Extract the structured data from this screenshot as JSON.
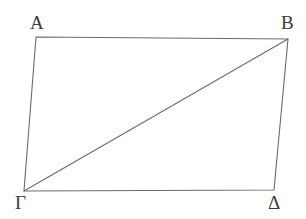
{
  "figure": {
    "type": "geometric-diagram",
    "shape": "parallelogram-with-diagonal",
    "background_color": "#ffffff",
    "stroke_color": "#6b6b6b",
    "stroke_width": 1.1,
    "label_color": "#3a3a3a",
    "canvas": {
      "width": 306,
      "height": 219
    },
    "vertices": [
      {
        "id": "A",
        "label": "Α",
        "x": 36,
        "y": 37
      },
      {
        "id": "B",
        "label": "Β",
        "x": 288,
        "y": 39
      },
      {
        "id": "D",
        "label": "Δ",
        "x": 274,
        "y": 190
      },
      {
        "id": "G",
        "label": "Γ",
        "x": 24,
        "y": 191
      }
    ],
    "edges": [
      {
        "id": "AB",
        "from": "A",
        "to": "B",
        "role": "top-side"
      },
      {
        "id": "BD",
        "from": "B",
        "to": "D",
        "role": "right-side"
      },
      {
        "id": "DG",
        "from": "D",
        "to": "G",
        "role": "bottom-side"
      },
      {
        "id": "GA",
        "from": "G",
        "to": "A",
        "role": "left-side"
      }
    ],
    "diagonals": [
      {
        "id": "GB",
        "from": "G",
        "to": "B",
        "role": "diagonal"
      }
    ],
    "outline_path": "M 36 37 L 288 39 L 274 190 L 24 191 Z",
    "diagonal_path": "M 24 191 L 288 39"
  }
}
